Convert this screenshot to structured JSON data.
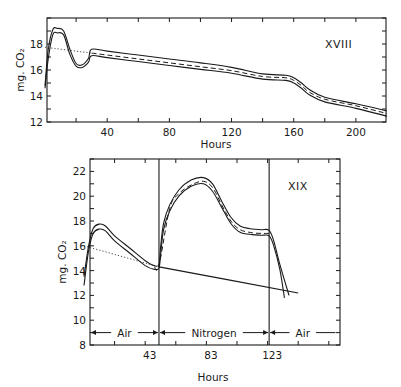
{
  "chart_data": [
    {
      "type": "line",
      "panel_label": "XVIII",
      "title": "",
      "xlabel": "Hours",
      "ylabel": "mg. CO₂",
      "xlim": [
        0,
        220
      ],
      "ylim": [
        12,
        20
      ],
      "xticks": [
        40,
        80,
        120,
        160,
        200
      ],
      "xtick_labels": [
        "40",
        "80",
        "120",
        "160",
        "200"
      ],
      "xminor_step": 20,
      "yticks": [
        12,
        14,
        16,
        18
      ],
      "ytick_labels": [
        "12",
        "14",
        "16",
        "18"
      ],
      "yminor_step": 1,
      "grid": false,
      "series": [
        {
          "name": "upper envelope",
          "style": "solid",
          "x": [
            0,
            2,
            5,
            8,
            12,
            16,
            20,
            24,
            28,
            30,
            40,
            60,
            80,
            100,
            120,
            140,
            155,
            160,
            165,
            170,
            180,
            200,
            220
          ],
          "y": [
            14.8,
            17.5,
            19.1,
            19.2,
            19.0,
            17.6,
            16.5,
            16.4,
            16.9,
            17.6,
            17.45,
            17.15,
            16.85,
            16.55,
            16.2,
            15.7,
            15.6,
            15.4,
            15.0,
            14.5,
            13.9,
            13.4,
            12.85
          ]
        },
        {
          "name": "mean",
          "style": "dashed",
          "x": [
            30,
            40,
            60,
            80,
            100,
            120,
            140,
            155,
            160,
            165,
            170,
            180,
            200,
            220
          ],
          "y": [
            17.3,
            17.15,
            16.85,
            16.55,
            16.25,
            15.95,
            15.5,
            15.4,
            15.2,
            14.8,
            14.3,
            13.75,
            13.25,
            12.65
          ]
        },
        {
          "name": "lower envelope",
          "style": "solid",
          "x": [
            0,
            2,
            5,
            8,
            12,
            16,
            20,
            24,
            28,
            30,
            40,
            60,
            80,
            100,
            120,
            140,
            155,
            160,
            165,
            170,
            180,
            200,
            220
          ],
          "y": [
            14.6,
            16.8,
            18.7,
            18.85,
            18.7,
            17.2,
            16.3,
            16.2,
            16.6,
            17.1,
            16.95,
            16.65,
            16.35,
            16.05,
            15.75,
            15.3,
            15.2,
            15.0,
            14.6,
            14.1,
            13.55,
            13.05,
            12.45
          ]
        },
        {
          "name": "extrapolated baseline",
          "style": "dotted",
          "x": [
            0,
            30
          ],
          "y": [
            17.75,
            17.3
          ]
        }
      ]
    },
    {
      "type": "line",
      "panel_label": "XIX",
      "title": "",
      "xlabel": "Hours",
      "ylabel": "mg. CO₂",
      "xlim": [
        0,
        165
      ],
      "ylim": [
        8,
        23
      ],
      "xticks": [
        43,
        83,
        123
      ],
      "xtick_labels": [
        "43",
        "83",
        "123"
      ],
      "xminor_step": 20,
      "yticks": [
        8,
        10,
        12,
        14,
        16,
        18,
        20,
        22
      ],
      "ytick_labels": [
        "8",
        "10",
        "12",
        "14",
        "16",
        "18",
        "20",
        "22"
      ],
      "yminor_step": 1,
      "grid": false,
      "phase_boundaries": [
        49,
        121
      ],
      "phases": [
        {
          "label": "Air",
          "from": 0,
          "to": 49
        },
        {
          "label": "Nitrogen",
          "from": 49,
          "to": 121
        },
        {
          "label": "Air",
          "from": 121,
          "to": 165
        }
      ],
      "series": [
        {
          "name": "upper envelope",
          "style": "solid",
          "x": [
            0,
            3,
            6,
            10,
            14,
            20,
            30,
            40,
            46,
            49,
            50,
            52,
            56,
            62,
            70,
            78,
            84,
            90,
            96,
            102,
            110,
            116,
            121,
            124,
            128,
            134
          ],
          "y": [
            13.5,
            16.0,
            17.4,
            17.75,
            17.6,
            16.8,
            15.8,
            14.8,
            14.4,
            14.5,
            15.8,
            17.8,
            19.3,
            20.5,
            21.3,
            21.5,
            21.0,
            19.6,
            18.3,
            17.6,
            17.35,
            17.3,
            17.25,
            16.4,
            14.5,
            12.0
          ]
        },
        {
          "name": "mean",
          "style": "dashed",
          "x": [
            46,
            49,
            56,
            62,
            70,
            78,
            84,
            90,
            96,
            102,
            110,
            116,
            121
          ],
          "y": [
            14.3,
            14.4,
            19.0,
            20.2,
            20.9,
            21.2,
            20.7,
            19.3,
            18.0,
            17.3,
            17.05,
            17.0,
            17.0
          ]
        },
        {
          "name": "lower envelope",
          "style": "solid",
          "x": [
            0,
            3,
            6,
            10,
            14,
            20,
            30,
            40,
            46,
            49,
            50,
            52,
            56,
            62,
            70,
            78,
            84,
            90,
            96,
            102,
            110,
            116,
            121,
            124,
            128,
            131
          ],
          "y": [
            12.8,
            15.6,
            17.0,
            17.35,
            17.2,
            16.4,
            15.4,
            14.4,
            14.1,
            14.2,
            15.2,
            17.3,
            18.8,
            20.0,
            20.8,
            21.0,
            20.4,
            19.1,
            17.8,
            17.1,
            16.9,
            16.85,
            16.8,
            16.0,
            14.1,
            11.8
          ]
        },
        {
          "name": "baseline line",
          "style": "solid",
          "x": [
            49,
            140
          ],
          "y": [
            14.3,
            12.2
          ]
        },
        {
          "name": "extrapolated baseline",
          "style": "dotted",
          "x": [
            0,
            46
          ],
          "y": [
            16.0,
            14.4
          ]
        }
      ]
    }
  ]
}
